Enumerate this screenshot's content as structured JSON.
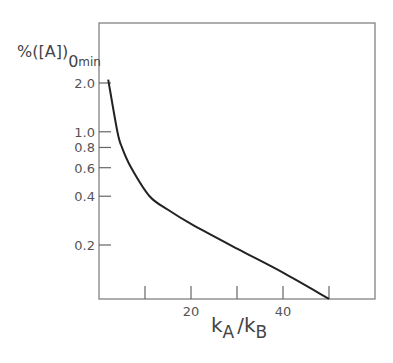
{
  "chart_data": {
    "type": "line",
    "title": "",
    "xlabel": "kA/kB",
    "xlabel_parts": {
      "k1": "k",
      "sub1": "A",
      "slash": "/",
      "k2": "k",
      "sub2": "B"
    },
    "ylabel": "%([A]0)min",
    "ylabel_parts": {
      "main": "%([A]",
      "close": ")",
      "sub0": "0",
      "submin": "min"
    },
    "x_scale": "linear",
    "y_scale": "log",
    "xlim": [
      0,
      60
    ],
    "ylim": [
      0.15,
      2.6
    ],
    "x_ticks": [
      10,
      20,
      30,
      40,
      50
    ],
    "x_tick_labels": [
      {
        "value": 20,
        "label": "20"
      },
      {
        "value": 40,
        "label": "40"
      }
    ],
    "y_ticks": [
      {
        "value": 2.0,
        "label": "2.0"
      },
      {
        "value": 1.0,
        "label": "1.0"
      },
      {
        "value": 0.8,
        "label": "0.8"
      },
      {
        "value": 0.6,
        "label": "0.6"
      },
      {
        "value": 0.4,
        "label": "0.4"
      },
      {
        "value": 0.2,
        "label": "0.2"
      }
    ],
    "grid": false,
    "legend": null,
    "series": [
      {
        "name": "%([A]0)min",
        "x": [
          2,
          4,
          5,
          7,
          11,
          15,
          20,
          30,
          40,
          50
        ],
        "y": [
          2.1,
          1.0,
          0.8,
          0.6,
          0.4,
          0.33,
          0.27,
          0.19,
          0.135,
          0.093
        ]
      }
    ]
  }
}
